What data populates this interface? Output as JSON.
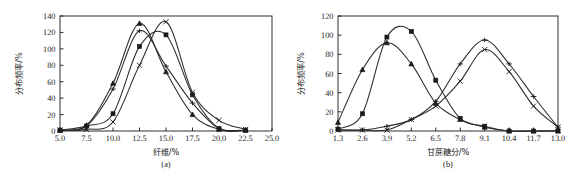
{
  "figure": {
    "background": "#ffffff",
    "ink": "#1a1a1a",
    "panel_a_caption": "(a)",
    "panel_b_caption": "(b)"
  },
  "chart_data": [
    {
      "type": "line",
      "panel": "a",
      "title": "",
      "caption": "(a)",
      "xlabel": "纤维/%",
      "ylabel": "分布频率/%",
      "xlim": [
        5.0,
        25.0
      ],
      "ylim": [
        0,
        140
      ],
      "xticks": [
        "5.0",
        "7.5",
        "10.0",
        "12.5",
        "15.0",
        "17.5",
        "20.0",
        "22.5",
        "25.0"
      ],
      "xtick_values": [
        5.0,
        7.5,
        10.0,
        12.5,
        15.0,
        17.5,
        20.0,
        22.5,
        25.0
      ],
      "yticks": [
        "0",
        "20",
        "40",
        "60",
        "80",
        "100",
        "120",
        "140"
      ],
      "ytick_values": [
        0,
        20,
        40,
        60,
        80,
        100,
        120,
        140
      ],
      "grid": false,
      "legend": "none",
      "x": [
        5.0,
        7.5,
        10.0,
        12.5,
        15.0,
        17.5,
        20.0,
        22.5
      ],
      "series": [
        {
          "name": "series-triangle",
          "marker": "triangle",
          "values": [
            1,
            7,
            58,
            131,
            72,
            20,
            2,
            1
          ]
        },
        {
          "name": "series-square",
          "marker": "square",
          "values": [
            1,
            6,
            21,
            103,
            117,
            44,
            3,
            1
          ]
        },
        {
          "name": "series-cross",
          "marker": "cross",
          "values": [
            1,
            2,
            11,
            80,
            133,
            47,
            13,
            2
          ]
        },
        {
          "name": "series-dash",
          "marker": "dash",
          "values": [
            1,
            6,
            51,
            122,
            79,
            34,
            3,
            1
          ]
        }
      ]
    },
    {
      "type": "line",
      "panel": "b",
      "title": "",
      "caption": "(b)",
      "xlabel": "甘蔗糖分/%",
      "ylabel": "分布频率/%",
      "xlim": [
        1.3,
        13.0
      ],
      "ylim": [
        0,
        120
      ],
      "xticks": [
        "1.3",
        "2.6",
        "3.9",
        "5.2",
        "6.5",
        "7.8",
        "9.1",
        "10.4",
        "11.7",
        "13.0"
      ],
      "xtick_values": [
        1.3,
        2.6,
        3.9,
        5.2,
        6.5,
        7.8,
        9.1,
        10.4,
        11.7,
        13.0
      ],
      "yticks": [
        "0",
        "20",
        "40",
        "60",
        "80",
        "100",
        "120"
      ],
      "ytick_values": [
        0,
        20,
        40,
        60,
        80,
        100,
        120
      ],
      "grid": false,
      "legend": "none",
      "x": [
        1.3,
        2.6,
        3.9,
        5.2,
        6.5,
        7.8,
        9.1,
        10.4,
        11.7,
        13.0
      ],
      "series": [
        {
          "name": "series-square-b",
          "marker": "square",
          "values": [
            2,
            18,
            98,
            104,
            53,
            13,
            5,
            0,
            0,
            0
          ]
        },
        {
          "name": "series-triangle-b",
          "marker": "triangle",
          "values": [
            9,
            64,
            92,
            70,
            29,
            12,
            4,
            0,
            0,
            0
          ]
        },
        {
          "name": "series-cross-b",
          "marker": "cross",
          "values": [
            1,
            1,
            1,
            12,
            26,
            52,
            85,
            62,
            26,
            4
          ]
        },
        {
          "name": "series-dash-b",
          "marker": "dash",
          "values": [
            1,
            1,
            5,
            12,
            31,
            70,
            95,
            70,
            36,
            4
          ]
        }
      ]
    }
  ]
}
